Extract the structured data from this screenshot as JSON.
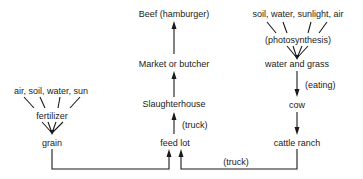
{
  "diagram": {
    "type": "flow",
    "nodes": {
      "beef": "Beef (hamburger)",
      "market": "Market or butcher",
      "slaughterhouse": "Slaughterhouse",
      "feed_lot": "feed lot",
      "grain": "grain",
      "fertilizer": "fertilizer",
      "grain_inputs": "air, soil, water, sun",
      "grass_inputs": "soil, water, sunlight, air",
      "photosynthesis": "(photosynthesis)",
      "water_grass": "water and grass",
      "cow": "cow",
      "cattle_ranch": "cattle ranch"
    },
    "edge_labels": {
      "truck_to_slaughter": "(truck)",
      "eating": "(eating)",
      "truck_ranch_to_feedlot": "(truck)"
    },
    "edges": [
      {
        "from": "grain_inputs",
        "to": "fertilizer"
      },
      {
        "from": "fertilizer",
        "to": "grain"
      },
      {
        "from": "grain",
        "to": "feed_lot"
      },
      {
        "from": "grass_inputs",
        "to": "photosynthesis"
      },
      {
        "from": "photosynthesis",
        "to": "water_grass"
      },
      {
        "from": "water_grass",
        "to": "cow",
        "label": "(eating)"
      },
      {
        "from": "cow",
        "to": "cattle_ranch"
      },
      {
        "from": "cattle_ranch",
        "to": "feed_lot",
        "label": "(truck)"
      },
      {
        "from": "feed_lot",
        "to": "slaughterhouse",
        "label": "(truck)"
      },
      {
        "from": "slaughterhouse",
        "to": "market"
      },
      {
        "from": "market",
        "to": "beef"
      }
    ],
    "line_color": "#1a1a1a"
  }
}
